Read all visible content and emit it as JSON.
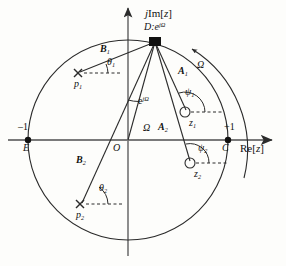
{
  "figure": {
    "type": "z-plane pole-zero diagram",
    "axes": {
      "imag_label": "jIm[z]",
      "real_label": "Re[z]",
      "origin_label": "O",
      "left_value": "–1",
      "right_value": "+1",
      "left_point_label": "E",
      "right_point_label": "C"
    },
    "unit_circle": {
      "center": [
        128,
        140
      ],
      "radius": 100,
      "stroke": "#2b2b2b"
    },
    "evaluation_point": {
      "label": "D:e",
      "exponent": "jΩ",
      "marker": "filled-square",
      "x": 155,
      "y": 42
    },
    "origin_vector": {
      "label": "e",
      "exponent": "jΩ",
      "angle_label": "Ω"
    },
    "frequency_arc": {
      "label": "Ω",
      "direction": "counterclockwise"
    },
    "zeros": [
      {
        "name": "z",
        "index": "1",
        "marker": "open-circle",
        "x": 185,
        "y": 112,
        "vector": "A",
        "vector_index": "1",
        "angle": "ψ",
        "angle_index": "1"
      },
      {
        "name": "z",
        "index": "2",
        "marker": "open-circle",
        "x": 190,
        "y": 163,
        "vector": "A",
        "vector_index": "2",
        "angle": "ψ",
        "angle_index": "2"
      }
    ],
    "poles": [
      {
        "name": "p",
        "index": "1",
        "marker": "cross",
        "x": 78,
        "y": 73,
        "vector": "B",
        "vector_index": "1",
        "angle": "θ",
        "angle_index": "1"
      },
      {
        "name": "p",
        "index": "2",
        "marker": "cross",
        "x": 80,
        "y": 204,
        "vector": "B",
        "vector_index": "2",
        "angle": "θ",
        "angle_index": "2"
      }
    ],
    "labels": {
      "A1": "A",
      "A1_sub": "1",
      "A2": "A",
      "A2_sub": "2",
      "B1": "B",
      "B1_sub": "1",
      "B2": "B",
      "B2_sub": "2",
      "psi1": "ψ",
      "psi1_sub": "1",
      "psi2": "ψ",
      "psi2_sub": "2",
      "theta1": "θ",
      "theta1_sub": "1",
      "theta2": "θ",
      "theta2_sub": "2",
      "z1": "z",
      "z1_sub": "1",
      "z2": "z",
      "z2_sub": "2",
      "p1": "p",
      "p1_sub": "1",
      "p2": "p",
      "p2_sub": "2",
      "omega_arc": "Ω",
      "omega_angle": "Ω"
    },
    "colors": {
      "stroke": "#2b2b2b",
      "axis": "#6e6e6e",
      "text": "#111111",
      "background": "#fdfdfb"
    }
  }
}
